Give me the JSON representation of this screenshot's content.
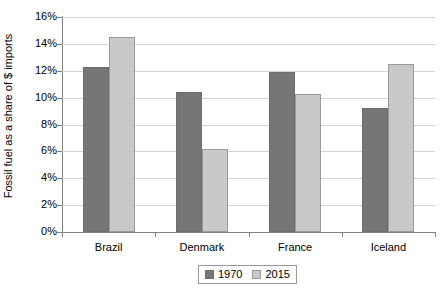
{
  "chart_data": {
    "type": "bar",
    "title": "",
    "xlabel": "",
    "ylabel": "Fossil fuel as a share of $ imports",
    "categories": [
      "Brazil",
      "Denmark",
      "France",
      "Iceland"
    ],
    "series": [
      {
        "name": "1970",
        "color": "#767676",
        "values": [
          12.3,
          10.4,
          11.9,
          9.2
        ]
      },
      {
        "name": "2015",
        "color": "#c9c9c9",
        "values": [
          14.5,
          6.2,
          10.3,
          12.5
        ]
      }
    ],
    "ylim": [
      0,
      16
    ],
    "ytick_values": [
      0,
      2,
      4,
      6,
      8,
      10,
      12,
      14,
      16
    ],
    "ytick_labels": [
      "0%",
      "2%",
      "4%",
      "6%",
      "8%",
      "10%",
      "12%",
      "14%",
      "16%"
    ],
    "grid": true,
    "legend_position": "bottom",
    "legend_entries": [
      "1970",
      "2015"
    ]
  }
}
